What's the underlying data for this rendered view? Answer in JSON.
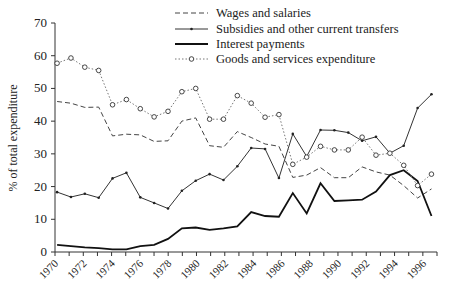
{
  "chart_data": {
    "type": "line",
    "title": "",
    "xlabel": "",
    "ylabel": "% of total expenditure",
    "ylim": [
      0,
      70
    ],
    "yticks": [
      0,
      10,
      20,
      30,
      40,
      50,
      60,
      70
    ],
    "xlim": [
      1970,
      1997
    ],
    "xtick_labels": [
      "1970",
      "1972",
      "1974",
      "1976",
      "1978",
      "1980",
      "1982",
      "1984",
      "1986",
      "1988",
      "1990",
      "1992",
      "1994",
      "1996"
    ],
    "grid": false,
    "legend_position": "top-center",
    "x": [
      1970,
      1971,
      1972,
      1973,
      1974,
      1975,
      1976,
      1977,
      1978,
      1979,
      1980,
      1981,
      1982,
      1983,
      1984,
      1985,
      1986,
      1987,
      1988,
      1989,
      1990,
      1991,
      1992,
      1993,
      1994,
      1995,
      1996,
      1997
    ],
    "series": [
      {
        "name": "Wages and salaries",
        "style": "dashed",
        "values": [
          46,
          45.5,
          44.2,
          44.3,
          35.5,
          36,
          35.8,
          33.8,
          34,
          40,
          41,
          32.5,
          32,
          36.8,
          35,
          33,
          32.3,
          22.8,
          23.5,
          25.8,
          22.7,
          22.7,
          26,
          24.5,
          23.5,
          20.3,
          16.5,
          19.3
        ]
      },
      {
        "name": "Subsidies and other current transfers",
        "style": "solid-thin-dot-markers",
        "values": [
          18.3,
          16.8,
          17.8,
          16.6,
          22.5,
          24.2,
          16.7,
          15,
          13.3,
          18.7,
          21.8,
          23.8,
          22,
          26.2,
          31.8,
          31.5,
          22.6,
          36.1,
          29.2,
          37.3,
          37.2,
          36.5,
          34,
          35.2,
          30.2,
          32.5,
          44,
          48.2
        ]
      },
      {
        "name": "Interest payments",
        "style": "solid-thick",
        "values": [
          2.2,
          1.8,
          1.4,
          1.2,
          0.8,
          0.8,
          1.8,
          2.2,
          4,
          7.2,
          7.5,
          6.8,
          7.2,
          7.8,
          12.2,
          11,
          10.8,
          18,
          11.8,
          21,
          15.6,
          15.8,
          16,
          18.5,
          23.5,
          25,
          21.7,
          11
        ]
      },
      {
        "name": "Goods and services expenditure",
        "style": "dotted-circle-markers",
        "values": [
          57.7,
          59.3,
          56.5,
          55.5,
          45,
          46.6,
          43.8,
          41.3,
          43,
          49,
          50,
          40.6,
          40.6,
          47.8,
          45.5,
          41.2,
          42,
          26.8,
          29,
          32.3,
          31.2,
          31.2,
          35.1,
          29.6,
          30.2,
          26.5,
          20.3,
          23.8
        ]
      }
    ]
  }
}
